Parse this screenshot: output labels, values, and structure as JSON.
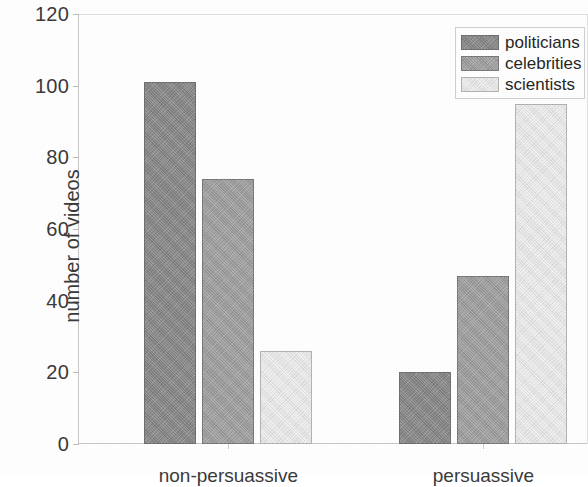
{
  "chart_data": {
    "type": "bar",
    "title": "",
    "subtitle": "",
    "xlabel": "",
    "ylabel": "number of videos",
    "categories": [
      "non-persuassive",
      "persuassive"
    ],
    "series": [
      {
        "name": "politicians",
        "values": [
          101,
          20
        ],
        "color": "#8d8d8d"
      },
      {
        "name": "celebrities",
        "values": [
          74,
          47
        ],
        "color": "#a2a2a2"
      },
      {
        "name": "scientists",
        "values": [
          26,
          95
        ],
        "color": "#e9e9e9"
      }
    ],
    "ylim": [
      0,
      120
    ],
    "yticks": [
      0,
      20,
      40,
      60,
      80,
      100,
      120
    ],
    "ytick_labels": [
      "0",
      "20",
      "40",
      "60",
      "80",
      "100",
      "120"
    ],
    "grid": false,
    "legend_position": "top-right",
    "annotations": []
  },
  "axes": {
    "y_title": "number of videos",
    "y_tick_labels": [
      "120",
      "100",
      "80",
      "60",
      "40",
      "20",
      "0"
    ],
    "x_tick_labels": [
      "non-persuassive",
      "persuassive"
    ]
  },
  "legend": {
    "entries": [
      {
        "label": "politicians",
        "swatch": "dark-gray-swatch"
      },
      {
        "label": "celebrities",
        "swatch": "medium-gray-swatch"
      },
      {
        "label": "scientists",
        "swatch": "light-gray-swatch"
      }
    ]
  }
}
